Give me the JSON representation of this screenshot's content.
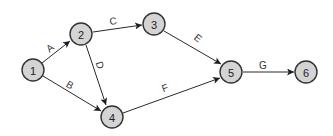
{
  "diagram": {
    "type": "network-precedence-diagram",
    "colors": {
      "node_fill": "#d4d4d4",
      "node_stroke": "#333333",
      "edge": "#2a2a2a",
      "text": "#222222",
      "background": "#ffffff"
    },
    "nodes": [
      {
        "id": "1",
        "label": "1",
        "x": 33,
        "y": 70
      },
      {
        "id": "2",
        "label": "2",
        "x": 81,
        "y": 34
      },
      {
        "id": "3",
        "label": "3",
        "x": 154,
        "y": 24
      },
      {
        "id": "4",
        "label": "4",
        "x": 112,
        "y": 117
      },
      {
        "id": "5",
        "label": "5",
        "x": 231,
        "y": 72
      },
      {
        "id": "6",
        "label": "6",
        "x": 306,
        "y": 72
      }
    ],
    "edges": [
      {
        "label": "A",
        "from": "1",
        "to": "2"
      },
      {
        "label": "B",
        "from": "1",
        "to": "4"
      },
      {
        "label": "C",
        "from": "2",
        "to": "3"
      },
      {
        "label": "D",
        "from": "2",
        "to": "4"
      },
      {
        "label": "E",
        "from": "3",
        "to": "5"
      },
      {
        "label": "F",
        "from": "4",
        "to": "5"
      },
      {
        "label": "G",
        "from": "5",
        "to": "6"
      }
    ]
  }
}
